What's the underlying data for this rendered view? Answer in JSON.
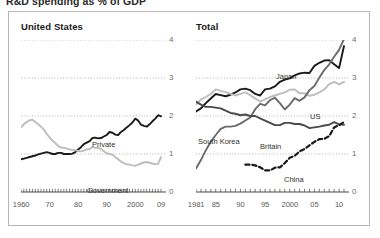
{
  "header": {
    "title": "R&D spending as % of GDP"
  },
  "panels": {
    "left": {
      "title": "United States",
      "y_ticks": [
        "0",
        "1",
        "2",
        "3",
        "4"
      ],
      "x_ticks": [
        "1960",
        "70",
        "80",
        "90",
        "2000",
        "09"
      ],
      "series_labels": {
        "private": "Private",
        "government": "Government"
      }
    },
    "right": {
      "title": "Total",
      "y_ticks": [
        "0",
        "1",
        "2",
        "3",
        "4"
      ],
      "x_ticks": [
        "1981",
        "85",
        "90",
        "95",
        "2000",
        "05",
        "10"
      ],
      "series_labels": {
        "japan": "Japan",
        "us": "US",
        "south_korea": "South Korea",
        "britain": "Britain",
        "china": "China"
      }
    }
  },
  "colors": {
    "black": "#1a1a1a",
    "light_gray": "#bdbdbd",
    "dark_gray": "#6b6b6b",
    "grid": "#9a9894",
    "axis": "#4a4845",
    "frame": "#b9b7b3",
    "tick_text": "#5a5855"
  },
  "chart_data": [
    {
      "type": "line",
      "title": "United States",
      "subtitle": "R&D spending as % of GDP",
      "xlabel": "",
      "ylabel": "",
      "xlim": [
        1960,
        2009
      ],
      "ylim": [
        0,
        4
      ],
      "yticks": [
        0,
        1,
        2,
        3,
        4
      ],
      "xticks": [
        1960,
        1970,
        1980,
        1990,
        2000,
        2009
      ],
      "grid": true,
      "legend": "inline-annotations",
      "series": [
        {
          "name": "Private",
          "color": "#1a1a1a",
          "style": "solid",
          "x": [
            1960,
            1961,
            1962,
            1963,
            1964,
            1965,
            1966,
            1967,
            1968,
            1969,
            1970,
            1971,
            1972,
            1973,
            1974,
            1975,
            1976,
            1977,
            1978,
            1979,
            1980,
            1981,
            1982,
            1983,
            1984,
            1985,
            1986,
            1987,
            1988,
            1989,
            1990,
            1991,
            1992,
            1993,
            1994,
            1995,
            1996,
            1997,
            1998,
            1999,
            2000,
            2001,
            2002,
            2003,
            2004,
            2005,
            2006,
            2007,
            2008,
            2009
          ],
          "values": [
            0.86,
            0.88,
            0.9,
            0.92,
            0.94,
            0.96,
            0.99,
            1.01,
            1.03,
            1.05,
            1.03,
            1.0,
            1.0,
            1.03,
            1.03,
            1.0,
            1.0,
            1.0,
            1.01,
            1.05,
            1.12,
            1.18,
            1.26,
            1.3,
            1.34,
            1.42,
            1.43,
            1.41,
            1.42,
            1.46,
            1.5,
            1.58,
            1.56,
            1.51,
            1.5,
            1.58,
            1.63,
            1.7,
            1.76,
            1.83,
            1.93,
            1.88,
            1.77,
            1.74,
            1.72,
            1.78,
            1.86,
            1.93,
            2.02,
            1.99
          ]
        },
        {
          "name": "Government",
          "color": "#bdbdbd",
          "style": "solid",
          "x": [
            1960,
            1961,
            1962,
            1963,
            1964,
            1965,
            1966,
            1967,
            1968,
            1969,
            1970,
            1971,
            1972,
            1973,
            1974,
            1975,
            1976,
            1977,
            1978,
            1979,
            1980,
            1981,
            1982,
            1983,
            1984,
            1985,
            1986,
            1987,
            1988,
            1989,
            1990,
            1991,
            1992,
            1993,
            1994,
            1995,
            1996,
            1997,
            1998,
            1999,
            2000,
            2001,
            2002,
            2003,
            2004,
            2005,
            2006,
            2007,
            2008,
            2009
          ],
          "values": [
            1.7,
            1.78,
            1.84,
            1.89,
            1.9,
            1.84,
            1.78,
            1.72,
            1.64,
            1.53,
            1.44,
            1.35,
            1.29,
            1.21,
            1.17,
            1.16,
            1.14,
            1.12,
            1.11,
            1.1,
            1.08,
            1.07,
            1.09,
            1.12,
            1.13,
            1.18,
            1.16,
            1.17,
            1.13,
            1.07,
            1.02,
            1.0,
            0.98,
            0.92,
            0.86,
            0.8,
            0.76,
            0.73,
            0.72,
            0.7,
            0.69,
            0.72,
            0.75,
            0.78,
            0.79,
            0.77,
            0.75,
            0.73,
            0.74,
            0.92
          ]
        }
      ]
    },
    {
      "type": "line",
      "title": "Total",
      "subtitle": "R&D spending as % of GDP",
      "xlabel": "",
      "ylabel": "",
      "xlim": [
        1981,
        2011
      ],
      "ylim": [
        0,
        4
      ],
      "yticks": [
        0,
        1,
        2,
        3,
        4
      ],
      "xticks": [
        1981,
        1985,
        1990,
        1995,
        2000,
        2005,
        2010
      ],
      "grid": true,
      "legend": "inline-annotations",
      "series": [
        {
          "name": "Japan",
          "color": "#1a1a1a",
          "style": "solid",
          "x": [
            1981,
            1982,
            1983,
            1984,
            1985,
            1986,
            1987,
            1988,
            1989,
            1990,
            1991,
            1992,
            1993,
            1994,
            1995,
            1996,
            1997,
            1998,
            1999,
            2000,
            2001,
            2002,
            2003,
            2004,
            2005,
            2006,
            2007,
            2008,
            2009,
            2010,
            2011
          ],
          "values": [
            2.12,
            2.2,
            2.34,
            2.46,
            2.58,
            2.55,
            2.52,
            2.56,
            2.62,
            2.7,
            2.72,
            2.68,
            2.58,
            2.54,
            2.7,
            2.72,
            2.78,
            2.9,
            2.96,
            2.99,
            3.07,
            3.12,
            3.14,
            3.13,
            3.32,
            3.4,
            3.46,
            3.47,
            3.36,
            3.26,
            3.84
          ]
        },
        {
          "name": "US",
          "color": "#bdbdbd",
          "style": "solid",
          "x": [
            1981,
            1982,
            1983,
            1984,
            1985,
            1986,
            1987,
            1988,
            1989,
            1990,
            1991,
            1992,
            1993,
            1994,
            1995,
            1996,
            1997,
            1998,
            1999,
            2000,
            2001,
            2002,
            2003,
            2004,
            2005,
            2006,
            2007,
            2008,
            2009,
            2010,
            2011
          ],
          "values": [
            2.3,
            2.44,
            2.5,
            2.58,
            2.7,
            2.66,
            2.63,
            2.58,
            2.54,
            2.58,
            2.62,
            2.55,
            2.46,
            2.38,
            2.44,
            2.5,
            2.54,
            2.58,
            2.62,
            2.69,
            2.7,
            2.6,
            2.6,
            2.53,
            2.56,
            2.62,
            2.7,
            2.84,
            2.9,
            2.83,
            2.9
          ]
        },
        {
          "name": "South Korea",
          "color": "#6b6b6b",
          "style": "solid",
          "x": [
            1981,
            1982,
            1983,
            1984,
            1985,
            1986,
            1987,
            1988,
            1989,
            1990,
            1991,
            1992,
            1993,
            1994,
            1995,
            1996,
            1997,
            1998,
            1999,
            2000,
            2001,
            2002,
            2003,
            2004,
            2005,
            2006,
            2007,
            2008,
            2009,
            2010,
            2011
          ],
          "values": [
            0.62,
            0.84,
            1.1,
            1.32,
            1.5,
            1.66,
            1.72,
            1.72,
            1.74,
            1.8,
            1.88,
            1.96,
            2.18,
            2.32,
            2.28,
            2.42,
            2.48,
            2.34,
            2.17,
            2.3,
            2.47,
            2.4,
            2.49,
            2.68,
            2.79,
            3.01,
            3.21,
            3.36,
            3.56,
            3.74,
            4.03
          ]
        },
        {
          "name": "Britain",
          "color": "#4a4a4a",
          "style": "solid",
          "x": [
            1981,
            1982,
            1983,
            1984,
            1985,
            1986,
            1987,
            1988,
            1989,
            1990,
            1991,
            1992,
            1993,
            1994,
            1995,
            1996,
            1997,
            1998,
            1999,
            2000,
            2001,
            2002,
            2003,
            2004,
            2005,
            2006,
            2007,
            2008,
            2009,
            2010,
            2011
          ],
          "values": [
            2.38,
            2.3,
            2.24,
            2.24,
            2.22,
            2.2,
            2.14,
            2.08,
            2.06,
            2.02,
            2.04,
            2.0,
            2.0,
            1.94,
            1.88,
            1.82,
            1.76,
            1.76,
            1.82,
            1.82,
            1.79,
            1.79,
            1.75,
            1.68,
            1.7,
            1.72,
            1.75,
            1.77,
            1.84,
            1.78,
            1.77
          ]
        },
        {
          "name": "China",
          "color": "#1a1a1a",
          "style": "dashed",
          "x": [
            1991,
            1992,
            1993,
            1994,
            1995,
            1996,
            1997,
            1998,
            1999,
            2000,
            2001,
            2002,
            2003,
            2004,
            2005,
            2006,
            2007,
            2008,
            2009,
            2010,
            2011
          ],
          "values": [
            0.72,
            0.72,
            0.7,
            0.65,
            0.57,
            0.57,
            0.64,
            0.65,
            0.76,
            0.9,
            0.95,
            1.07,
            1.13,
            1.23,
            1.32,
            1.39,
            1.4,
            1.47,
            1.7,
            1.76,
            1.84
          ]
        }
      ]
    }
  ]
}
